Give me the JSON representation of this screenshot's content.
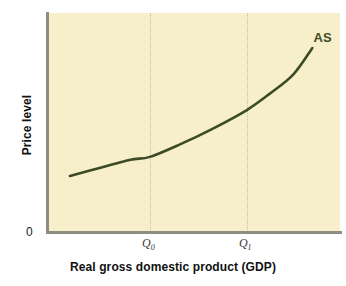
{
  "chart_data": {
    "type": "line",
    "title": "",
    "xlabel": "Real gross domestic product (GDP)",
    "ylabel": "Price level",
    "origin_label": "0",
    "grid": true,
    "legend_position": "inline-end-of-curve",
    "xlim": [
      0,
      1
    ],
    "ylim": [
      0,
      1
    ],
    "xticks": [
      "Q",
      "Q"
    ],
    "xtick_subscripts": [
      "0",
      "1"
    ],
    "series": [
      {
        "name": "AS",
        "label": "AS",
        "color": "#3d4a28",
        "description": "Upward-sloping convex short-run aggregate supply curve",
        "points": [
          {
            "x": 0.072,
            "y": 0.256
          },
          {
            "x": 0.18,
            "y": 0.295
          },
          {
            "x": 0.28,
            "y": 0.33
          },
          {
            "x": 0.347,
            "y": 0.343
          },
          {
            "x": 0.45,
            "y": 0.4
          },
          {
            "x": 0.56,
            "y": 0.47
          },
          {
            "x": 0.68,
            "y": 0.557
          },
          {
            "x": 0.76,
            "y": 0.633
          },
          {
            "x": 0.84,
            "y": 0.72
          },
          {
            "x": 0.905,
            "y": 0.84
          }
        ]
      }
    ],
    "annotations": [
      {
        "name": "q0-gridline",
        "x": 0.347,
        "style": "dotted-vertical"
      },
      {
        "name": "q1-gridline",
        "x": 0.68,
        "style": "dotted-vertical"
      }
    ]
  },
  "axes": {
    "y_title": "Price level",
    "x_title": "Real gross domestic product (GDP)",
    "origin": "0"
  },
  "ticks": {
    "q0": {
      "base": "Q",
      "sub": "0"
    },
    "q1": {
      "base": "Q",
      "sub": "1"
    }
  },
  "curve": {
    "label": "AS"
  },
  "colors": {
    "plot_background": "#f7efc9",
    "page_background": "#ffffff",
    "axis": "#8d8d82",
    "curve": "#3d4a28",
    "gridline": "#c9bfa0",
    "text": "#111111"
  }
}
